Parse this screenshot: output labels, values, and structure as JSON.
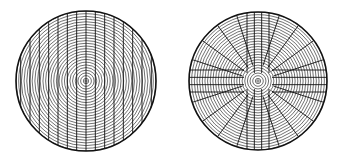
{
  "figure": {
    "background": "#ffffff",
    "stroke": "#111111",
    "panels": [
      {
        "id": "left",
        "description": "Concentric rings crossed by parallel vertical chords",
        "center": [
          86,
          81
        ],
        "radius": 70,
        "ring_count": 26,
        "vertical_line_count": 15
      },
      {
        "id": "right",
        "description": "Concentric rings with cross-shaped band of parallel lines and radial spokes in quadrants",
        "center": [
          258,
          81
        ],
        "radius": 69,
        "ring_count": 26,
        "band_half_width": 11,
        "band_line_count": 4,
        "spoke_count_per_quadrant": 4
      }
    ]
  }
}
